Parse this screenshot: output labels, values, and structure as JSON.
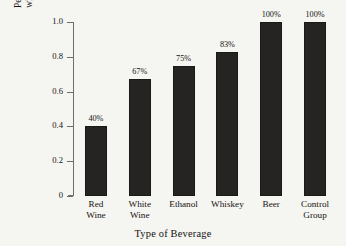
{
  "chart_data": {
    "type": "bar",
    "title": "",
    "xlabel": "Type of Beverage",
    "ylabel": "Percent of Coronary Arteries with Atherosclerotic Lesions",
    "ylabel_lines": [
      "Percent of Coronary Arteries",
      "with Atherosclerotic Lesions"
    ],
    "categories": [
      "Red Wine",
      "White Wine",
      "Ethanol",
      "Whiskey",
      "Beer",
      "Control Group"
    ],
    "category_lines": [
      [
        "Red",
        "Wine"
      ],
      [
        "White",
        "Wine"
      ],
      [
        "Ethanol"
      ],
      [
        "Whiskey"
      ],
      [
        "Beer"
      ],
      [
        "Control",
        "Group"
      ]
    ],
    "values": [
      0.4,
      0.67,
      0.75,
      0.83,
      1.0,
      1.0
    ],
    "data_labels": [
      "40%",
      "67%",
      "75%",
      "83%",
      "100%",
      "100%"
    ],
    "ylim": [
      0,
      1.0
    ],
    "yticks": [
      0,
      0.2,
      0.4,
      0.6,
      0.8,
      1.0
    ],
    "ytick_labels": [
      "0",
      "0.2",
      "0.4",
      "0.6",
      "0.8",
      "1.0"
    ],
    "grid": false,
    "legend": false,
    "bar_color": "#262423",
    "background_color": "#f5f5f2",
    "axis_color": "#6e6e6a",
    "text_color": "#15120f"
  }
}
